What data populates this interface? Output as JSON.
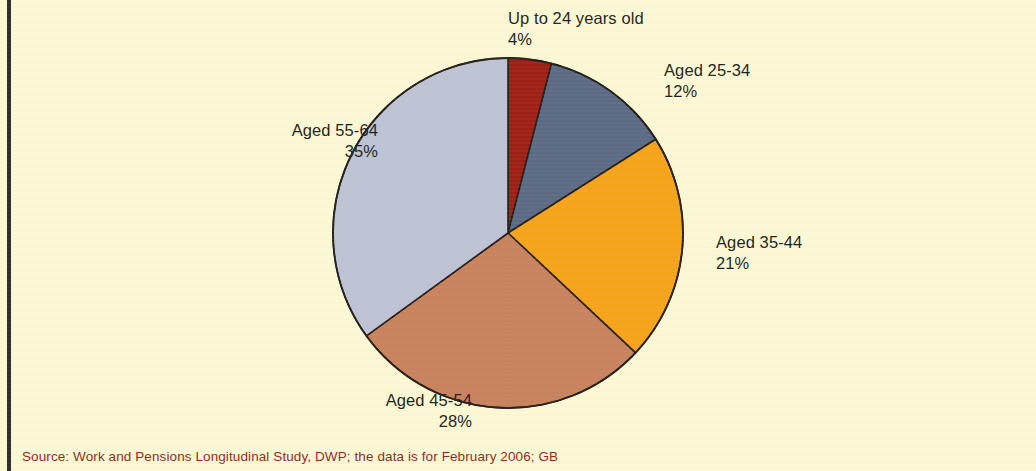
{
  "figure": {
    "background_color": "#fbf8d5",
    "rule_color": "#2b2b2b",
    "source_note": "Source: Work and Pensions Longitudinal Study, DWP; the data is for February 2006; GB",
    "source_note_color": "#93291f"
  },
  "chart_data": {
    "type": "pie",
    "title": "",
    "subtitle": "",
    "xlabel": "",
    "ylabel": "",
    "grid": false,
    "legend_position": "none",
    "labels_outside": true,
    "start_angle_deg": 0,
    "direction": "clockwise",
    "units": "percent",
    "total": 100,
    "categories": [
      "Up to 24 years old",
      "Aged 25-34",
      "Aged 35-44",
      "Aged 45-54",
      "Aged 55-64"
    ],
    "values": [
      4,
      12,
      21,
      28,
      35
    ],
    "value_labels": [
      "4%",
      "12%",
      "21%",
      "28%",
      "35%"
    ],
    "colors": [
      "#9e1f15",
      "#5b6b86",
      "#f6a31c",
      "#c8825e",
      "#bdc3d5"
    ],
    "slice_edge_color": "#241f1c",
    "slices": [
      {
        "name": "Up to 24 years old",
        "value": 4,
        "value_label": "4%",
        "color": "#9e1f15",
        "start_deg": 0,
        "end_deg": 14.4
      },
      {
        "name": "Aged 25-34",
        "value": 12,
        "value_label": "12%",
        "color": "#5b6b86",
        "start_deg": 14.4,
        "end_deg": 57.6
      },
      {
        "name": "Aged 35-44",
        "value": 21,
        "value_label": "21%",
        "color": "#f6a31c",
        "start_deg": 57.6,
        "end_deg": 133.2
      },
      {
        "name": "Aged 45-54",
        "value": 28,
        "value_label": "28%",
        "color": "#c8825e",
        "start_deg": 133.2,
        "end_deg": 234.0
      },
      {
        "name": "Aged 55-64",
        "value": 35,
        "value_label": "35%",
        "color": "#bdc3d5",
        "start_deg": 234.0,
        "end_deg": 360.0
      }
    ]
  },
  "labels": {
    "up_to_24": {
      "name": "Up to 24 years old",
      "pct": "4%"
    },
    "aged_25_34": {
      "name": "Aged 25-34",
      "pct": "12%"
    },
    "aged_35_44": {
      "name": "Aged 35-44",
      "pct": "21%"
    },
    "aged_45_54": {
      "name": "Aged 45-54",
      "pct": "28%"
    },
    "aged_55_64": {
      "name": "Aged 55-64",
      "pct": "35%"
    }
  }
}
